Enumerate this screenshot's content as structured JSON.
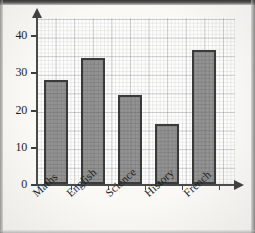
{
  "chart_data": {
    "type": "bar",
    "title": "",
    "xlabel": "",
    "ylabel": "",
    "categories": [
      "Maths",
      "English",
      "Science",
      "History",
      "French"
    ],
    "values": [
      28,
      34,
      24,
      16,
      36
    ],
    "ylim": [
      0,
      44
    ],
    "yticks": [
      0,
      10,
      20,
      30,
      40
    ],
    "ytick_labels": [
      "0",
      "10",
      "20",
      "30",
      "40"
    ],
    "grid": true,
    "grid_style": "graph-paper-squares",
    "legend": "none",
    "bar_fill_color": "#7c7c7c",
    "bar_border_color": "#3a3a3a",
    "axis_color": "#4a4a4a",
    "background_color": "#fdfdfb",
    "x_axis_arrow": true,
    "y_axis_arrow": true,
    "label_rotation_deg": -42
  },
  "axes": {
    "y_tick_labels": [
      {
        "text": "40",
        "value": 40
      },
      {
        "text": "30",
        "value": 30
      },
      {
        "text": "20",
        "value": 20
      },
      {
        "text": "10",
        "value": 10
      },
      {
        "text": "0",
        "value": 0
      }
    ],
    "x_categories": [
      {
        "label": "Maths"
      },
      {
        "label": "English"
      },
      {
        "label": "Science"
      },
      {
        "label": "History"
      },
      {
        "label": "French"
      }
    ]
  }
}
